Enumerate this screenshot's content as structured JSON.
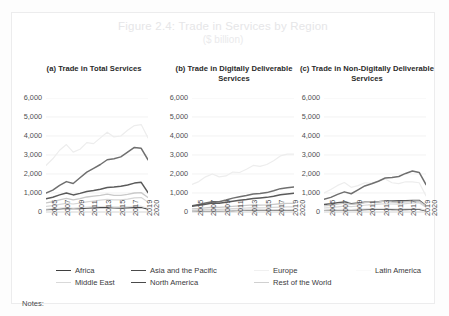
{
  "figure": {
    "title": "Figure 2.4: Trade in Services by Region",
    "subtitle": "($ billion)",
    "notes_label": "Notes:"
  },
  "legend": {
    "items": [
      {
        "label": "Africa",
        "color": "#3f3f3f",
        "row": 0,
        "col": 0
      },
      {
        "label": "Asia and the Pacific",
        "color": "#4a4a4a",
        "row": 0,
        "col": 1
      },
      {
        "label": "Europe",
        "color": "#f0f0f0",
        "row": 0,
        "col": 2
      },
      {
        "label": "Latin America",
        "color": "#fafafa",
        "row": 0,
        "col": 3
      },
      {
        "label": "Middle East",
        "color": "#d9d9d9",
        "row": 1,
        "col": 0
      },
      {
        "label": "North America",
        "color": "#4a4a4a",
        "row": 1,
        "col": 1
      },
      {
        "label": "Rest of the World",
        "color": "#d0d0d0",
        "row": 1,
        "col": 2
      }
    ]
  },
  "chart_data": [
    {
      "type": "line",
      "panel": "a",
      "title": "(a) Trade in Total Services",
      "xlabel": "",
      "ylabel": "",
      "ylim": [
        0,
        6000
      ],
      "yticks": [
        0,
        1000,
        2000,
        3000,
        4000,
        5000,
        6000
      ],
      "ytick_labels": [
        "0",
        "1,000",
        "2,000",
        "3,000",
        "4,000",
        "5,000",
        "6,000"
      ],
      "grid": true,
      "legend_position": "bottom",
      "x": [
        2005,
        2006,
        2007,
        2008,
        2009,
        2010,
        2011,
        2012,
        2013,
        2014,
        2015,
        2016,
        2017,
        2018,
        2019,
        2020
      ],
      "xtick_labels": [
        "2005",
        "2007",
        "2009",
        "2011",
        "2013",
        "2015",
        "2017",
        "2019",
        "2020"
      ],
      "series": [
        {
          "name": "Europe",
          "color": "#ededed",
          "width": 1.2,
          "values": [
            2450,
            2800,
            3250,
            3550,
            3150,
            3300,
            3650,
            3600,
            3900,
            4200,
            3950,
            4000,
            4300,
            4550,
            4600,
            3900
          ]
        },
        {
          "name": "Asia and the Pacific",
          "color": "#6f6f6f",
          "width": 1.5,
          "values": [
            1000,
            1150,
            1400,
            1600,
            1500,
            1800,
            2100,
            2300,
            2500,
            2750,
            2800,
            2900,
            3150,
            3400,
            3350,
            2750
          ]
        },
        {
          "name": "North America",
          "color": "#5a5a5a",
          "width": 1.5,
          "values": [
            700,
            780,
            900,
            1000,
            900,
            980,
            1080,
            1130,
            1200,
            1290,
            1320,
            1360,
            1420,
            1520,
            1560,
            1020
          ]
        },
        {
          "name": "Rest of the World",
          "color": "#c9c9c9",
          "width": 1.3,
          "values": [
            480,
            540,
            640,
            720,
            640,
            700,
            790,
            840,
            880,
            940,
            880,
            870,
            930,
            1000,
            1020,
            760
          ]
        },
        {
          "name": "Middle East",
          "color": "#d6d6d6",
          "width": 1.2,
          "values": [
            300,
            340,
            400,
            450,
            420,
            470,
            530,
            580,
            620,
            660,
            640,
            640,
            680,
            740,
            760,
            520
          ]
        },
        {
          "name": "Africa",
          "color": "#494949",
          "width": 1.2,
          "values": [
            120,
            140,
            165,
            190,
            170,
            180,
            200,
            215,
            225,
            235,
            210,
            205,
            215,
            230,
            235,
            150
          ]
        },
        {
          "name": "Latin America",
          "color": "#e2e2e2",
          "width": 1.2,
          "values": [
            150,
            170,
            200,
            230,
            205,
            230,
            260,
            280,
            290,
            300,
            275,
            270,
            285,
            300,
            305,
            195
          ]
        }
      ]
    },
    {
      "type": "line",
      "panel": "b",
      "title": "(b) Trade in Digitally Deliverable Services",
      "xlabel": "",
      "ylabel": "",
      "ylim": [
        0,
        6000
      ],
      "yticks": [
        0,
        1000,
        2000,
        3000,
        4000,
        5000,
        6000
      ],
      "ytick_labels": [
        "0",
        "1,000",
        "2,000",
        "3,000",
        "4,000",
        "5,000",
        "6,000"
      ],
      "grid": true,
      "legend_position": "bottom",
      "x": [
        2005,
        2006,
        2007,
        2008,
        2009,
        2010,
        2011,
        2012,
        2013,
        2014,
        2015,
        2016,
        2017,
        2018,
        2019,
        2020
      ],
      "xtick_labels": [
        "2005",
        "2007",
        "2009",
        "2011",
        "2013",
        "2015",
        "2017",
        "2019",
        "2020"
      ],
      "series": [
        {
          "name": "Europe",
          "color": "#ededed",
          "width": 1.2,
          "values": [
            1450,
            1600,
            1850,
            2000,
            1850,
            1900,
            2100,
            2080,
            2250,
            2450,
            2400,
            2500,
            2700,
            2950,
            3050,
            3050
          ]
        },
        {
          "name": "Asia and the Pacific",
          "color": "#6f6f6f",
          "width": 1.5,
          "values": [
            330,
            390,
            470,
            540,
            540,
            630,
            730,
            800,
            870,
            950,
            980,
            1020,
            1120,
            1230,
            1270,
            1310
          ]
        },
        {
          "name": "North America",
          "color": "#5a5a5a",
          "width": 1.5,
          "values": [
            300,
            350,
            410,
            470,
            460,
            510,
            570,
            620,
            660,
            710,
            740,
            770,
            830,
            910,
            950,
            990
          ]
        },
        {
          "name": "Rest of the World",
          "color": "#c9c9c9",
          "width": 1.3,
          "values": [
            160,
            185,
            220,
            250,
            240,
            265,
            300,
            325,
            345,
            370,
            365,
            370,
            400,
            435,
            450,
            450
          ]
        },
        {
          "name": "Middle East",
          "color": "#d6d6d6",
          "width": 1.2,
          "values": [
            90,
            105,
            125,
            145,
            140,
            155,
            175,
            195,
            210,
            225,
            220,
            225,
            240,
            260,
            270,
            265
          ]
        },
        {
          "name": "Africa",
          "color": "#494949",
          "width": 1.2,
          "values": [
            40,
            46,
            55,
            63,
            60,
            65,
            73,
            80,
            85,
            90,
            84,
            83,
            88,
            95,
            98,
            90
          ]
        },
        {
          "name": "Latin America",
          "color": "#e2e2e2",
          "width": 1.2,
          "values": [
            50,
            58,
            69,
            80,
            74,
            83,
            94,
            102,
            108,
            113,
            105,
            104,
            110,
            118,
            122,
            112
          ]
        }
      ]
    },
    {
      "type": "line",
      "panel": "c",
      "title": "(c) Trade in Non-Digitally Deliverable Services",
      "xlabel": "",
      "ylabel": "",
      "ylim": [
        0,
        6000
      ],
      "yticks": [
        0,
        1000,
        2000,
        3000,
        4000,
        5000,
        6000
      ],
      "ytick_labels": [
        "0",
        "1,000",
        "2,000",
        "3,000",
        "4,000",
        "5,000",
        "6,000"
      ],
      "grid": true,
      "legend_position": "bottom",
      "x": [
        2005,
        2006,
        2007,
        2008,
        2009,
        2010,
        2011,
        2012,
        2013,
        2014,
        2015,
        2016,
        2017,
        2018,
        2019,
        2020
      ],
      "xtick_labels": [
        "2005",
        "2007",
        "2009",
        "2011",
        "2013",
        "2015",
        "2017",
        "2019",
        "2020"
      ],
      "series": [
        {
          "name": "Europe",
          "color": "#ededed",
          "width": 1.2,
          "values": [
            1000,
            1180,
            1400,
            1550,
            1300,
            1390,
            1540,
            1510,
            1640,
            1740,
            1540,
            1490,
            1590,
            1590,
            1540,
            850
          ]
        },
        {
          "name": "Asia and the Pacific",
          "color": "#6f6f6f",
          "width": 1.5,
          "values": [
            670,
            770,
            930,
            1060,
            960,
            1160,
            1370,
            1490,
            1620,
            1790,
            1810,
            1870,
            2030,
            2160,
            2080,
            1440
          ]
        },
        {
          "name": "North America",
          "color": "#5a5a5a",
          "width": 1.5,
          "values": [
            400,
            430,
            490,
            530,
            440,
            470,
            510,
            510,
            540,
            580,
            580,
            590,
            590,
            610,
            610,
            330
          ]
        },
        {
          "name": "Rest of the World",
          "color": "#c9c9c9",
          "width": 1.3,
          "values": [
            320,
            355,
            420,
            470,
            400,
            435,
            490,
            515,
            535,
            570,
            515,
            500,
            530,
            565,
            570,
            310
          ]
        },
        {
          "name": "Middle East",
          "color": "#d6d6d6",
          "width": 1.2,
          "values": [
            210,
            235,
            275,
            305,
            280,
            315,
            355,
            385,
            410,
            435,
            420,
            415,
            440,
            480,
            490,
            255
          ]
        },
        {
          "name": "Africa",
          "color": "#494949",
          "width": 1.2,
          "values": [
            80,
            94,
            110,
            127,
            110,
            115,
            127,
            135,
            140,
            145,
            126,
            122,
            127,
            135,
            137,
            60
          ]
        },
        {
          "name": "Latin America",
          "color": "#e2e2e2",
          "width": 1.2,
          "values": [
            100,
            112,
            131,
            150,
            131,
            147,
            166,
            178,
            182,
            187,
            170,
            166,
            175,
            182,
            183,
            83
          ]
        }
      ]
    }
  ]
}
